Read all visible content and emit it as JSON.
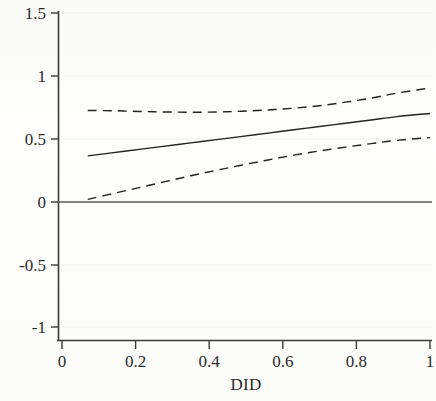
{
  "figure": {
    "kind": "marginal-effects-plot",
    "background_color": "#fdfdfc",
    "line_color": "#222222",
    "grid_color": "#ededea"
  },
  "chart_data": {
    "type": "line",
    "title": "",
    "subtitle": "",
    "xlabel": "DID",
    "ylabel": "",
    "xlim": [
      0,
      1
    ],
    "ylim": [
      -1,
      1.5
    ],
    "xticks": [
      0,
      0.2,
      0.4,
      0.6,
      0.8,
      1
    ],
    "xticklabels": [
      "0",
      "0.2",
      "0.4",
      "0.6",
      "0.8",
      "1"
    ],
    "yticks": [
      -1,
      -0.5,
      0,
      0.5,
      1,
      1.5
    ],
    "yticklabels": [
      "-1",
      "-0.5",
      "0",
      "0.5",
      "1",
      "1.5"
    ],
    "grid": "faint-horizontal",
    "legend": "none",
    "zero_reference_line": {
      "name": "zero-line",
      "y": 0,
      "style": "solid",
      "color": "#555555",
      "width": 1.2,
      "spans_full_axis": true
    },
    "x": [
      0.07,
      0.14,
      0.21,
      0.28,
      0.35,
      0.42,
      0.49,
      0.56,
      0.63,
      0.7,
      0.77,
      0.84,
      0.91,
      1.0
    ],
    "series": [
      {
        "name": "point-estimate",
        "label": "Marginal effect",
        "style": "solid",
        "color": "#222222",
        "width": 1.4,
        "values": [
          0.362,
          0.388,
          0.414,
          0.44,
          0.466,
          0.492,
          0.518,
          0.544,
          0.57,
          0.596,
          0.622,
          0.648,
          0.675,
          0.7
        ]
      },
      {
        "name": "upper-confidence-bound",
        "label": "Upper 95% CI",
        "style": "dashed",
        "color": "#222222",
        "width": 1.4,
        "values": [
          0.724,
          0.722,
          0.716,
          0.712,
          0.71,
          0.712,
          0.718,
          0.728,
          0.742,
          0.762,
          0.79,
          0.822,
          0.862,
          0.903
        ]
      },
      {
        "name": "lower-confidence-bound",
        "label": "Lower 95% CI",
        "style": "dashed",
        "color": "#222222",
        "width": 1.4,
        "values": [
          0.016,
          0.063,
          0.11,
          0.157,
          0.204,
          0.248,
          0.29,
          0.33,
          0.368,
          0.402,
          0.432,
          0.46,
          0.486,
          0.508
        ]
      }
    ]
  },
  "axes": {
    "x_title": "DID",
    "x_tick_labels": [
      "0",
      "0.2",
      "0.4",
      "0.6",
      "0.8",
      "1"
    ],
    "y_tick_labels": [
      "1.5",
      "1",
      "0.5",
      "0",
      "-0.5",
      "-1"
    ]
  }
}
